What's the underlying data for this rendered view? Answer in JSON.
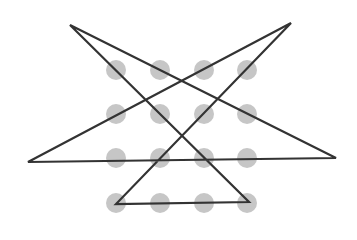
{
  "diagram": {
    "type": "dot-grid-line-puzzle",
    "grid": {
      "rows": 4,
      "cols": 4,
      "col_x": [
        116,
        160,
        204,
        247
      ],
      "row_y": [
        70,
        114,
        158,
        203
      ],
      "dot_radius": 10,
      "dot_color": "#c6c6c6"
    },
    "path": {
      "closed": true,
      "stroke_color": "#333333",
      "stroke_width": 2.2,
      "points": [
        [
          70,
          25
        ],
        [
          249,
          202
        ],
        [
          116,
          204
        ],
        [
          291,
          23
        ],
        [
          28,
          162
        ],
        [
          336,
          158
        ]
      ]
    }
  }
}
